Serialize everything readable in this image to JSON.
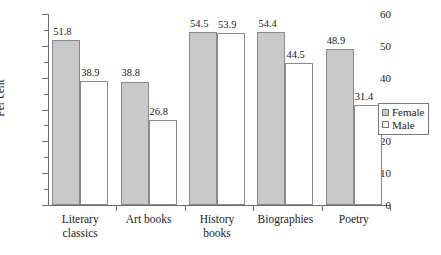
{
  "chart_data": {
    "type": "bar",
    "title": "",
    "xlabel": "",
    "ylabel": "Per cent",
    "ylim": [
      0,
      60
    ],
    "ytick_step": 10,
    "yminor_step": 5,
    "grid": false,
    "legend_position": "right",
    "categories": [
      "Literary classics",
      "Art books",
      "History books",
      "Biographies",
      "Poetry"
    ],
    "series": [
      {
        "name": "Female",
        "color": "#c9c9c9",
        "values": [
          51.8,
          38.8,
          54.5,
          54.4,
          48.9
        ]
      },
      {
        "name": "Male",
        "color": "#ffffff",
        "values": [
          38.9,
          26.8,
          53.9,
          44.5,
          31.4
        ]
      }
    ],
    "ytick_labels": [
      "0",
      "10",
      "20",
      "30",
      "40",
      "50",
      "60"
    ],
    "data_labels": [
      [
        "51.8",
        "38.9"
      ],
      [
        "38.8",
        "26.8"
      ],
      [
        "54.5",
        "53.9"
      ],
      [
        "54.4",
        "44.5"
      ],
      [
        "48.9",
        "31.4"
      ]
    ]
  },
  "axis": {
    "y_title": "Per cent",
    "y_ticks": [
      {
        "value": 60,
        "label": "60"
      },
      {
        "value": 50,
        "label": "50"
      },
      {
        "value": 40,
        "label": "40"
      },
      {
        "value": 30,
        "label": "30"
      },
      {
        "value": 20,
        "label": "20"
      },
      {
        "value": 10,
        "label": "10"
      },
      {
        "value": 0,
        "label": "0"
      }
    ],
    "y_minor_ticks": [
      55,
      45,
      35,
      25,
      15,
      5
    ]
  },
  "categories": [
    {
      "label": "Literary\nclassics"
    },
    {
      "label": "Art books"
    },
    {
      "label": "History\nbooks"
    },
    {
      "label": "Biographies"
    },
    {
      "label": "Poetry"
    }
  ],
  "legend": {
    "items": [
      {
        "label": "Female",
        "swatch": "filled-gray-square"
      },
      {
        "label": "Male",
        "swatch": "empty-white-square"
      }
    ]
  }
}
